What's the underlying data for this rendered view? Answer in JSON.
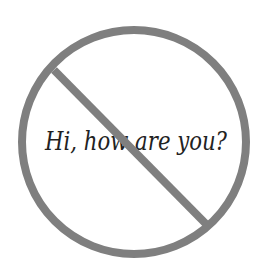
{
  "sign": {
    "type": "prohibition-sign",
    "message": "Hi, how are you?",
    "ring_color": "#7f7f7f",
    "text_color": "#222222",
    "background": "#ffffff"
  }
}
